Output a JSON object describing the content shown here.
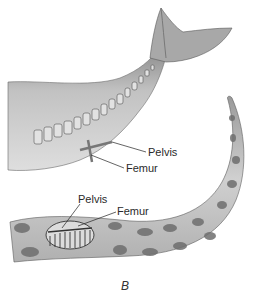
{
  "figure": {
    "panel_label": "B",
    "whale": {
      "labels": {
        "pelvis": "Pelvis",
        "femur": "Femur"
      }
    },
    "snake": {
      "labels": {
        "pelvis": "Pelvis",
        "femur": "Femur"
      }
    }
  },
  "colors": {
    "background": "#ffffff",
    "whale_body": "#b8b8b8",
    "whale_shadow": "#7a7a7a",
    "snake_body": "#c4c4c4",
    "snake_spots": "#6e6e6e",
    "bone": "#e8e8e8",
    "leader_line": "#222222"
  }
}
